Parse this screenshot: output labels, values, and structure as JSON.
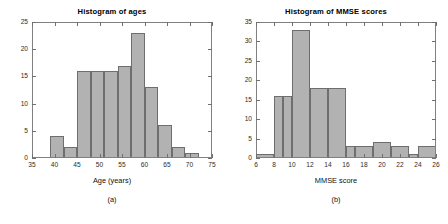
{
  "figure": {
    "width": 448,
    "height": 224,
    "background": "#ffffff",
    "bar_fill": "#b2b2b2",
    "bar_edge": "#6e6e6e",
    "axis_color": "#808080"
  },
  "panels": [
    {
      "caption": "(a)",
      "chart_data": {
        "type": "bar",
        "title": "Histogram of ages",
        "xlabel": "Age (years)",
        "ylabel": "",
        "xlim": [
          35,
          75
        ],
        "ylim": [
          0,
          25
        ],
        "xticks": [
          35,
          40,
          45,
          50,
          55,
          60,
          65,
          70,
          75
        ],
        "yticks": [
          0,
          5,
          10,
          15,
          20,
          25
        ],
        "grid": false,
        "legend": "none",
        "bin_edges": [
          39,
          42,
          45,
          48,
          51,
          54,
          57,
          60,
          63,
          66,
          69,
          72
        ],
        "categories": [
          "39-42",
          "42-45",
          "45-48",
          "48-51",
          "51-54",
          "54-57",
          "57-60",
          "60-63",
          "63-66",
          "66-69",
          "69-72"
        ],
        "values": [
          4,
          2,
          16,
          16,
          16,
          17,
          23,
          13,
          6,
          2,
          1
        ]
      }
    },
    {
      "caption": "(b)",
      "chart_data": {
        "type": "bar",
        "title": "Histogram of MMSE scores",
        "xlabel": "MMSE score",
        "ylabel": "",
        "xlim": [
          6,
          26
        ],
        "ylim": [
          0,
          35
        ],
        "xticks": [
          6,
          8,
          10,
          12,
          14,
          16,
          18,
          20,
          22,
          24,
          26
        ],
        "yticks": [
          0,
          5,
          10,
          15,
          20,
          25,
          30,
          35
        ],
        "grid": false,
        "legend": "none",
        "bin_edges": [
          6,
          8,
          9,
          10,
          12,
          14,
          16,
          17,
          19,
          21,
          23,
          24,
          26
        ],
        "categories": [
          "6-8",
          "8-9",
          "9-10",
          "10-12",
          "12-14",
          "14-16",
          "16-17",
          "17-19",
          "19-21",
          "21-23",
          "23-24",
          "24-26"
        ],
        "values": [
          1,
          16,
          16,
          33,
          18,
          18,
          3,
          3,
          4,
          3,
          1,
          3
        ]
      }
    }
  ]
}
